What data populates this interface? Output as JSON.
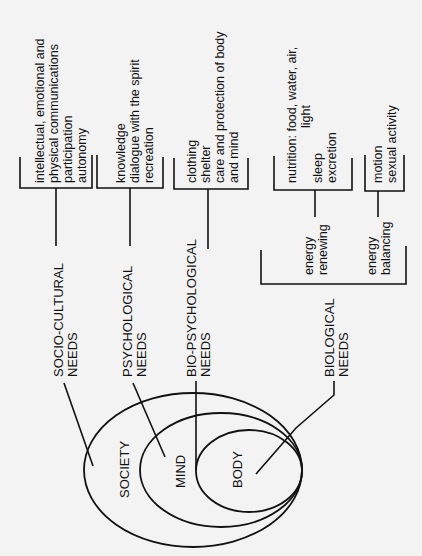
{
  "diagram": {
    "orientation": "rotated-90-ccw",
    "circles": [
      {
        "label": "SOCIETY"
      },
      {
        "label": "MIND"
      },
      {
        "label": "BODY"
      }
    ],
    "needs": [
      {
        "lines": [
          "SOCIO-CULTURAL",
          "NEEDS"
        ]
      },
      {
        "lines": [
          "PSYCHOLOGICAL",
          "NEEDS"
        ]
      },
      {
        "lines": [
          "BIO-PSYCHOLOGICAL",
          "NEEDS"
        ]
      },
      {
        "lines": [
          "BIOLOGICAL",
          "NEEDS"
        ]
      }
    ],
    "groups": [
      {
        "lines": [
          "intellectual, emotional and",
          "physical communications",
          "participation",
          "autonomy"
        ]
      },
      {
        "lines": [
          "knowledge",
          "dialogue with the spirit",
          "recreation"
        ]
      },
      {
        "lines": [
          "clothing",
          "shelter",
          "care and protection of body",
          "and mind"
        ]
      },
      {
        "lines": [
          "nutrition: food, water, air,",
          "light",
          "",
          "sleep",
          "excretion"
        ]
      },
      {
        "lines": [
          "motion",
          "sexual activity"
        ]
      }
    ],
    "energy": [
      {
        "lines": [
          "energy",
          "renewing"
        ]
      },
      {
        "lines": [
          "energy",
          "balancing"
        ]
      }
    ],
    "colors": {
      "ink": "#111111",
      "paper": "#f3f3f3"
    }
  }
}
